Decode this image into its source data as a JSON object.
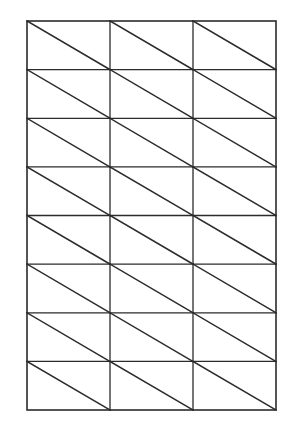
{
  "document": {
    "kind": "line-drawing",
    "title": "Triangulated Rectangular Grid",
    "background_color": "#ffffff",
    "page_width": 292,
    "page_height": 434
  },
  "figure": {
    "name": "triangulated-rectangular-grid",
    "stroke_color": "#2b2b2b",
    "fill_color": "#ffffff",
    "outer_stroke_width": 1.6,
    "grid_stroke_width": 1.3,
    "diagonal_stroke_width": 1.5,
    "bounds": {
      "x": 27,
      "y": 21,
      "width": 249,
      "height": 389
    },
    "columns": 3,
    "rows": 8,
    "cell_width": 83,
    "cell_height": 48.6,
    "diagonal_direction": "top-left-to-bottom-right",
    "triangle_count": 48,
    "vertical_line_x": [
      27,
      110,
      193,
      276
    ],
    "horizontal_line_y": [
      21,
      69.6,
      118.3,
      166.9,
      215.5,
      264.1,
      312.8,
      361.4,
      410
    ]
  }
}
